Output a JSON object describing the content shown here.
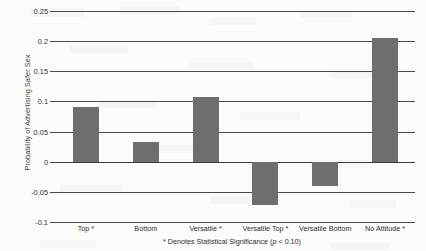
{
  "chart_data": {
    "type": "bar",
    "title": "",
    "xlabel": "",
    "ylabel": "Probability of Advertising Safer Sex",
    "categories": [
      "Top *",
      "Bottom",
      "Versatile *",
      "Versatile Top *",
      "Versatile Bottom",
      "No Attitude *"
    ],
    "values": [
      0.09,
      0.033,
      0.107,
      -0.072,
      -0.041,
      0.206
    ],
    "ylim": [
      -0.1,
      0.25
    ],
    "yticks": [
      0.25,
      0.2,
      0.15,
      0.1,
      0.05,
      0,
      -0.05,
      -0.1
    ],
    "ytick_labels": [
      "0.25",
      "0.2",
      "0.15",
      "0.1",
      "0.05",
      "0",
      "-0.05",
      "-0.1"
    ],
    "grid": true,
    "legend": "none",
    "bar_color": "#6e6e6e",
    "annotations": [
      "* Denotes Statistical Significance (p < 0.10)"
    ]
  },
  "footnote": {
    "prefix": "* Denotes Statistical Significance (",
    "italic": "p",
    "suffix": " < 0.10)"
  }
}
